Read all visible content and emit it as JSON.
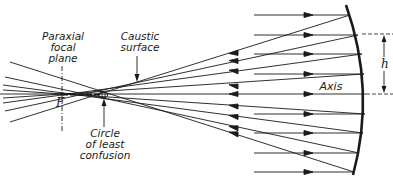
{
  "diagram": {
    "labels": {
      "paraxial_focal_plane": "Paraxial\nfocal\nplane",
      "caustic_surface": "Caustic\nsurface",
      "circle_of_least_confusion": "Circle\nof least\nconfusion",
      "focal_point": "F",
      "axis": "Axis",
      "height": "h"
    },
    "colors": {
      "line": "#1a1a1a",
      "background": "#ffffff"
    },
    "geometry": {
      "axis_y": 94,
      "mirror": {
        "top": [
          346,
          5
        ],
        "vertex": [
          366,
          94
        ],
        "bottom": [
          353,
          175
        ]
      },
      "incoming_ray_start_x": 254,
      "incoming_ray_heights": [
        15,
        35,
        54,
        74,
        94,
        114,
        133,
        153,
        172
      ],
      "paraxial_focus": [
        62,
        94
      ],
      "circle_of_least_confusion_center": [
        104,
        95
      ]
    }
  }
}
